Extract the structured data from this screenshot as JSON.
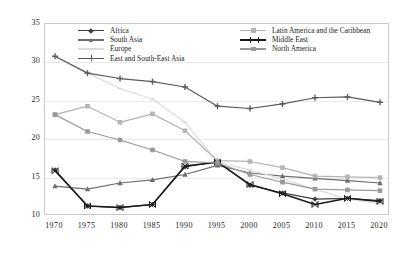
{
  "chart_data": {
    "type": "line",
    "title": "",
    "subtitle": "",
    "xlabel": "",
    "ylabel": "",
    "x": [
      1970,
      1975,
      1980,
      1985,
      1990,
      1995,
      2000,
      2005,
      2010,
      2015,
      2020
    ],
    "categories": [
      "1970",
      "1975",
      "1980",
      "1985",
      "1990",
      "1995",
      "2000",
      "2005",
      "2010",
      "2015",
      "2020"
    ],
    "xlim": [
      1970,
      2020
    ],
    "ylim": [
      10,
      35
    ],
    "yticks": [
      10,
      15,
      20,
      25,
      30,
      35
    ],
    "ytick_labels": [
      "10",
      "15",
      "20",
      "25",
      "30",
      "35"
    ],
    "grid": "horizontal",
    "legend_position": "top-inside-two-columns",
    "series": [
      {
        "name": "Africa",
        "color": "#3d3d3d",
        "marker": "diamond",
        "values": [
          16.0,
          11.3,
          11.1,
          11.5,
          16.4,
          17.1,
          14.0,
          13.0,
          12.2,
          12.3,
          12.0
        ]
      },
      {
        "name": "South Asia",
        "color": "#6e6e6e",
        "marker": "triangle",
        "values": [
          13.9,
          13.5,
          14.3,
          14.7,
          15.4,
          16.6,
          15.6,
          15.2,
          14.9,
          14.6,
          14.3
        ]
      },
      {
        "name": "Europe",
        "color": "#dcdcdc",
        "marker": "line",
        "values": [
          30.8,
          28.6,
          26.6,
          25.2,
          22.2,
          17.0,
          16.0,
          14.8,
          13.5,
          12.2,
          11.6
        ]
      },
      {
        "name": "East and South-East Asia",
        "color": "#5a5a5a",
        "marker": "plus",
        "values": [
          30.8,
          28.6,
          27.9,
          27.5,
          26.8,
          24.3,
          24.0,
          24.6,
          25.4,
          25.5,
          24.8
        ]
      },
      {
        "name": "Latin America and the Caribbean",
        "color": "#b4b4b4",
        "marker": "square",
        "values": [
          23.2,
          24.3,
          22.2,
          23.3,
          21.1,
          17.2,
          17.1,
          16.3,
          15.2,
          15.1,
          15.0
        ]
      },
      {
        "name": "Middle East",
        "color": "#1a1a1a",
        "marker": "bowtie",
        "values": [
          15.9,
          11.3,
          11.1,
          11.5,
          16.5,
          17.0,
          14.1,
          12.9,
          11.5,
          12.3,
          11.9
        ]
      },
      {
        "name": "North America",
        "color": "#9a9a9a",
        "marker": "square",
        "values": [
          23.2,
          21.0,
          19.9,
          18.6,
          17.1,
          16.9,
          15.4,
          14.4,
          13.5,
          13.4,
          13.3
        ]
      }
    ]
  }
}
